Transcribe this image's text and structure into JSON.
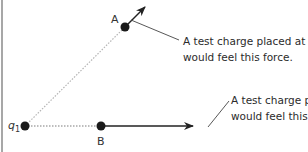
{
  "diagram": {
    "charge": {
      "label": "q",
      "subscript": "1"
    },
    "points": {
      "a": {
        "label": "A"
      },
      "b": {
        "label": "B"
      }
    },
    "callouts": {
      "a": {
        "line1": "A test charge placed at A",
        "line2": "would feel this force."
      },
      "b": {
        "line1": "A test charge placed at B",
        "line2": "would feel this force."
      }
    },
    "colors": {
      "ink": "#222222",
      "dotted": "#b0b0b0",
      "border": "#888888"
    }
  }
}
